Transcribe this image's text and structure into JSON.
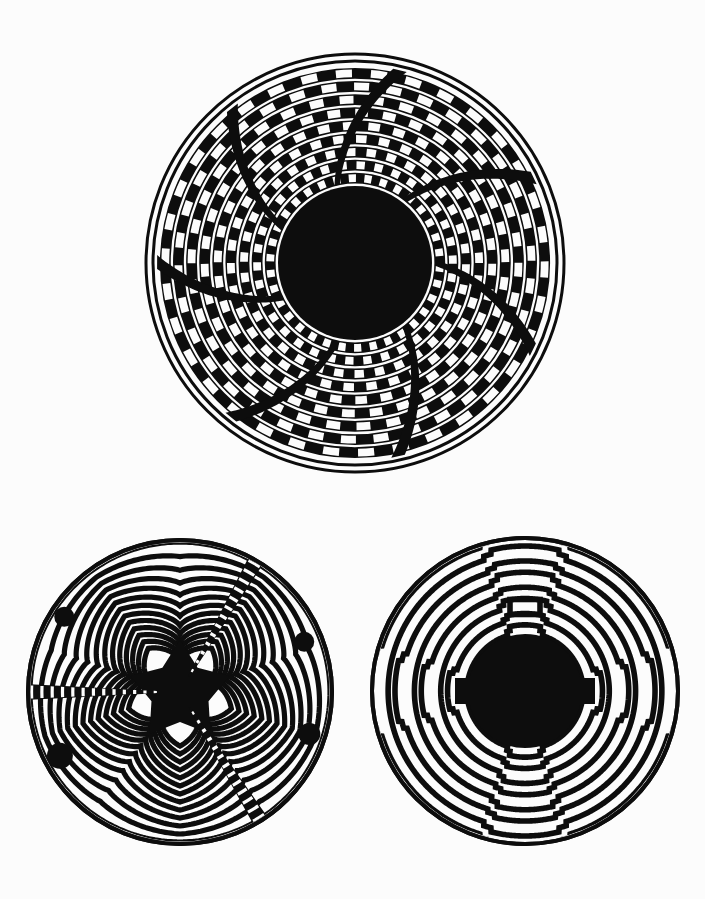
{
  "page": {
    "background_color": "#fcfcfc",
    "ink_color": "#0d0d0d",
    "width": 705,
    "height": 899,
    "medium": "black and white line plate",
    "figure_count": 3
  },
  "figures": [
    {
      "id": "figure-top",
      "name": "radial-pinwheel-basket",
      "caption": "",
      "center": {
        "x": 355,
        "y": 263
      },
      "outer_radius": 209,
      "rim": {
        "outer_stroke": 3,
        "inner_gap": 4,
        "inner_stroke": 3,
        "label": "double hairline rim"
      },
      "center_disc": {
        "radius": 77,
        "color": "#0d0d0d",
        "label": "solid black hub"
      },
      "weave": {
        "type": "pinwheel-spiral",
        "arm_count": 7,
        "band_count": 9,
        "band_inner_radius": 80,
        "band_outer_radius": 198,
        "band_width": 9.6,
        "band_gap": 3.4,
        "spiral_skew_deg": 26,
        "tick_count_per_band": 34,
        "duty_cycle": 0.5,
        "phase_step_deg": 5.1,
        "description": "Concentric arcs broken into alternating black and white rectangular ticks; the phase of each ring advances so the breaks line up along seven spiralling arms."
      }
    },
    {
      "id": "figure-bottom-left",
      "name": "five-point-star-labyrinth",
      "caption": "",
      "center": {
        "x": 180,
        "y": 692
      },
      "outer_radius": 152,
      "rim": {
        "outer_stroke": 4,
        "inner_gap": 0,
        "inner_stroke": 0,
        "label": "single heavy rim"
      },
      "center_disc": {
        "radius": 44,
        "color": "#0d0d0d",
        "label": "solid black five-pointed star hub"
      },
      "star": {
        "points": 5,
        "outer_radius": 52,
        "inner_radius": 30,
        "rotation_deg": -90
      },
      "weave": {
        "type": "star-contour-maze",
        "ring_count": 13,
        "ring_inner_radius": 54,
        "ring_outer_radius": 150,
        "line_width": 5.2,
        "ring_gap": 7.8,
        "dashed_spokes_deg": [
          180,
          58,
          300
        ],
        "dashed_spoke_width_deg": 6,
        "dash_count": 26,
        "description": "Thirteen nested five-pointed star contours that soften into circles at the rim, crossed by three checkered radial spokes that break every ring into dashes."
      }
    },
    {
      "id": "figure-bottom-right",
      "name": "stepped-concentric-labyrinth",
      "caption": "",
      "center": {
        "x": 525,
        "y": 691
      },
      "outer_radius": 153,
      "rim": {
        "outer_stroke": 4,
        "inner_gap": 0,
        "inner_stroke": 0,
        "label": "single heavy rim"
      },
      "center_disc": {
        "radius": 57,
        "color": "#0d0d0d",
        "label": "solid black hub"
      },
      "weave": {
        "type": "stepped-concentric-rings",
        "ring_count": 8,
        "ring_inner_radius": 58,
        "ring_outer_radius": 150,
        "line_width": 5.6,
        "ring_gap": 6.2,
        "notch_axes_deg": [
          90,
          270,
          0,
          180
        ],
        "notch_step_count": 4,
        "notch_half_width_deg": 14,
        "keystone_at_top": true,
        "description": "Eight concentric heavy rings, each interrupted at the four cardinal axes by square stepped notches that jog outward, with a small keystone rectangle capping the top axis."
      }
    }
  ],
  "legend": {
    "visible": false,
    "entries": []
  }
}
